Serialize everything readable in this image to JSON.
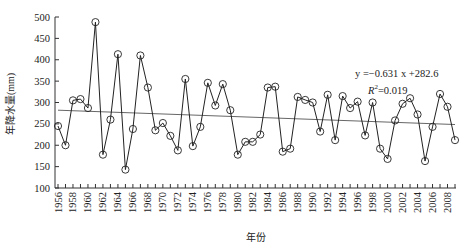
{
  "chart_data": {
    "type": "line",
    "title": "",
    "xlabel": "年份",
    "ylabel": "年降水量(mm)",
    "ylim": [
      100,
      500
    ],
    "yticks": [
      100,
      150,
      200,
      250,
      300,
      350,
      400,
      450,
      500
    ],
    "xlim": [
      1956,
      2009
    ],
    "xtick_labels": [
      "1956",
      "1958",
      "1960",
      "1962",
      "1964",
      "1966",
      "1968",
      "1970",
      "1972",
      "1974",
      "1976",
      "1978",
      "1980",
      "1982",
      "1984",
      "1986",
      "1988",
      "1990",
      "1992",
      "1994",
      "1996",
      "1998",
      "2000",
      "2002",
      "2004",
      "2006",
      "2008"
    ],
    "grid": false,
    "legend": null,
    "x": [
      1956,
      1957,
      1958,
      1959,
      1960,
      1961,
      1962,
      1963,
      1964,
      1965,
      1966,
      1967,
      1968,
      1969,
      1970,
      1971,
      1972,
      1973,
      1974,
      1975,
      1976,
      1977,
      1978,
      1979,
      1980,
      1981,
      1982,
      1983,
      1984,
      1985,
      1986,
      1987,
      1988,
      1989,
      1990,
      1991,
      1992,
      1993,
      1994,
      1995,
      1996,
      1997,
      1998,
      1999,
      2000,
      2001,
      2002,
      2003,
      2004,
      2005,
      2006,
      2007,
      2008,
      2009
    ],
    "series": [
      {
        "name": "年降水量",
        "marker": "open-circle",
        "values": [
          245,
          200,
          305,
          308,
          287,
          488,
          178,
          260,
          413,
          143,
          238,
          410,
          335,
          235,
          252,
          222,
          188,
          355,
          198,
          243,
          346,
          293,
          343,
          282,
          178,
          208,
          208,
          225,
          335,
          337,
          185,
          192,
          313,
          306,
          300,
          232,
          318,
          212,
          315,
          287,
          302,
          223,
          300,
          192,
          168,
          258,
          297,
          310,
          272,
          163,
          243,
          320,
          290,
          212
        ]
      },
      {
        "name": "线性趋势",
        "type": "trendline",
        "slope": -0.631,
        "intercept": 282.6,
        "start": [
          1956,
          282.0
        ],
        "end": [
          2009,
          248.5
        ]
      }
    ],
    "annotations": [
      {
        "text": "y =−0.631 x +282.6"
      },
      {
        "text": "R² =0.019"
      }
    ]
  },
  "labels": {
    "xlabel": "年份",
    "ylabel": "年降水量(mm)",
    "equation": "y =−0.631 x +282.6",
    "r2_prefix": "R",
    "r2_sup": "2",
    "r2_value": "=0.019"
  }
}
